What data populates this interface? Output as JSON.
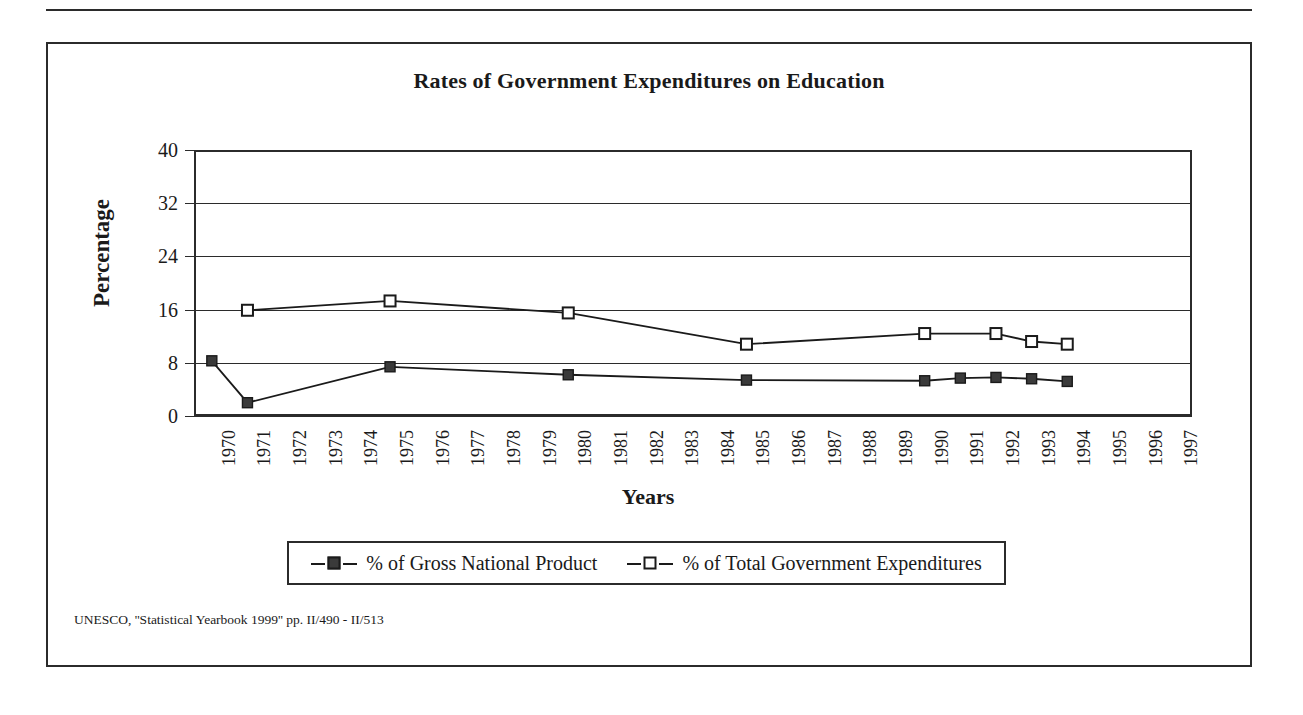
{
  "figure": {
    "title": "Rates of Government Expenditures on Education",
    "source_note": "UNESCO, ''Statistical Yearbook 1999'' pp. II/490 - II/513"
  },
  "legend": {
    "entries": [
      {
        "label": "% of Gross National Product",
        "marker": "filled-square-marker"
      },
      {
        "label": "% of Total Government Expenditures",
        "marker": "open-square-marker"
      }
    ]
  },
  "chart_data": {
    "type": "line",
    "title": "Rates of Government Expenditures on Education",
    "xlabel": "Years",
    "ylabel": "Percentage",
    "ylim": [
      0,
      40
    ],
    "yticks": [
      0,
      8,
      16,
      24,
      32,
      40
    ],
    "grid": true,
    "legend_position": "bottom",
    "categories": [
      "1970",
      "1971",
      "1972",
      "1973",
      "1974",
      "1975",
      "1976",
      "1977",
      "1978",
      "1979",
      "1980",
      "1981",
      "1982",
      "1983",
      "1984",
      "1985",
      "1986",
      "1987",
      "1988",
      "1989",
      "1990",
      "1991",
      "1992",
      "1993",
      "1994",
      "1995",
      "1996",
      "1997"
    ],
    "series": [
      {
        "name": "% of Gross National Product",
        "marker": "filled-square",
        "points": [
          {
            "x": "1970",
            "y": 8.3
          },
          {
            "x": "1971",
            "y": 2.0
          },
          {
            "x": "1975",
            "y": 7.4
          },
          {
            "x": "1980",
            "y": 6.2
          },
          {
            "x": "1985",
            "y": 5.4
          },
          {
            "x": "1990",
            "y": 5.3
          },
          {
            "x": "1991",
            "y": 5.7
          },
          {
            "x": "1992",
            "y": 5.8
          },
          {
            "x": "1993",
            "y": 5.6
          },
          {
            "x": "1994",
            "y": 5.2
          }
        ]
      },
      {
        "name": "% of Total Government Expenditures",
        "marker": "open-square",
        "points": [
          {
            "x": "1971",
            "y": 15.9
          },
          {
            "x": "1975",
            "y": 17.3
          },
          {
            "x": "1980",
            "y": 15.5
          },
          {
            "x": "1985",
            "y": 10.8
          },
          {
            "x": "1990",
            "y": 12.4
          },
          {
            "x": "1992",
            "y": 12.4
          },
          {
            "x": "1993",
            "y": 11.2
          },
          {
            "x": "1994",
            "y": 10.8
          }
        ]
      }
    ]
  },
  "colors": {
    "ink": "#1a1a1a",
    "line": "#2b2b2b",
    "marker_fill": "#3a3a3a",
    "background": "#ffffff"
  }
}
